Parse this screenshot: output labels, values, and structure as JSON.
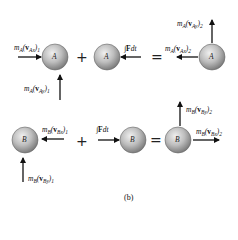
{
  "diagram": {
    "caption": "(b)",
    "rows": [
      {
        "particle": "A",
        "spheres": [
          "A",
          "A",
          "A"
        ],
        "operators": [
          "+",
          "="
        ],
        "labels": {
          "initial_x": {
            "m": "m",
            "ms": "A",
            "v": "v",
            "vs": "Ax",
            "idx": "1"
          },
          "initial_y": {
            "m": "m",
            "ms": "A",
            "v": "v",
            "vs": "Ay",
            "idx": "1"
          },
          "impulse": {
            "int": "∫",
            "F": "F",
            "dt": "dt"
          },
          "final_x": {
            "m": "m",
            "ms": "A",
            "v": "v",
            "vs": "Ax",
            "idx": "2"
          },
          "final_y": {
            "m": "m",
            "ms": "A",
            "v": "v",
            "vs": "Ay",
            "idx": "2"
          }
        }
      },
      {
        "particle": "B",
        "spheres": [
          "B",
          "B",
          "B"
        ],
        "operators": [
          "+",
          "="
        ],
        "labels": {
          "initial_x": {
            "m": "m",
            "ms": "B",
            "v": "v",
            "vs": "Bx",
            "idx": "1"
          },
          "initial_y": {
            "m": "m",
            "ms": "B",
            "v": "v",
            "vs": "By",
            "idx": "1"
          },
          "impulse": {
            "int": "∫",
            "F": "F",
            "dt": "dt"
          },
          "final_x": {
            "m": "m",
            "ms": "B",
            "v": "v",
            "vs": "Bx",
            "idx": "2"
          },
          "final_y": {
            "m": "m",
            "ms": "B",
            "v": "v",
            "vs": "By",
            "idx": "2"
          }
        }
      }
    ],
    "colors": {
      "sphere_light": "#e6e6e6",
      "sphere_dark": "#8a8a8a",
      "arrow": "#111111"
    }
  }
}
